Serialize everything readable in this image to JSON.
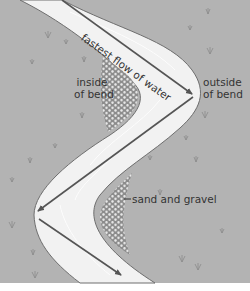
{
  "diagram": {
    "labels": {
      "fastest_flow": "fastest flow of water",
      "inside_bend_line1": "inside",
      "inside_bend_line2": "of bend",
      "outside_bend_line1": "outside",
      "outside_bend_line2": "of bend",
      "sand_gravel": "sand and gravel"
    },
    "colors": {
      "land": "#b3b3b3",
      "river": "#f2f2f2",
      "river_edge": "#6e6e6e",
      "arrow": "#555555",
      "gravel_bg": "#8c8c8c",
      "gravel_dot": "#e8e8e8",
      "text": "#333333",
      "bottom_strip": "#ffffff"
    },
    "icons": [
      "grass-tuft-icon",
      "arrow-icon"
    ]
  }
}
